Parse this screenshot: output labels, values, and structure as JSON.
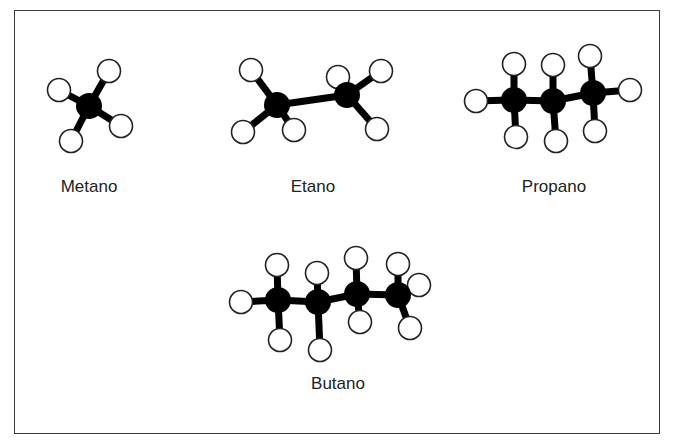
{
  "diagram": {
    "type": "ball-and-stick molecular models",
    "colors": {
      "carbon": "#000000",
      "hydrogen_fill": "#ffffff",
      "hydrogen_stroke": "#222222",
      "frame": "#3a3a3a"
    },
    "molecules": [
      {
        "name": "Metano",
        "carbons": [
          [
            89,
            106
          ]
        ],
        "hydrogens": [
          [
            59,
            90
          ],
          [
            109,
            71
          ],
          [
            121,
            126
          ],
          [
            71,
            141
          ]
        ],
        "bonds": [
          [
            89,
            106,
            59,
            90
          ],
          [
            89,
            106,
            109,
            71
          ],
          [
            89,
            106,
            121,
            126
          ],
          [
            89,
            106,
            71,
            141
          ]
        ],
        "label_pos": [
          89,
          192
        ]
      },
      {
        "name": "Etano",
        "carbons": [
          [
            277,
            105
          ],
          [
            347,
            95
          ]
        ],
        "hydrogens": [
          [
            251,
            70
          ],
          [
            243,
            132
          ],
          [
            294,
            130
          ],
          [
            338,
            77
          ],
          [
            381,
            71
          ],
          [
            377,
            129
          ]
        ],
        "bonds": [
          [
            277,
            105,
            347,
            95
          ],
          [
            277,
            105,
            251,
            70
          ],
          [
            277,
            105,
            243,
            132
          ],
          [
            277,
            105,
            294,
            130
          ],
          [
            347,
            95,
            338,
            77
          ],
          [
            347,
            95,
            381,
            71
          ],
          [
            347,
            95,
            377,
            129
          ]
        ],
        "label_pos": [
          313,
          192
        ]
      },
      {
        "name": "Propano",
        "carbons": [
          [
            514,
            100
          ],
          [
            553,
            101
          ],
          [
            593,
            93
          ]
        ],
        "hydrogens": [
          [
            476,
            101
          ],
          [
            514,
            64
          ],
          [
            516,
            137
          ],
          [
            553,
            65
          ],
          [
            556,
            141
          ],
          [
            590,
            56
          ],
          [
            595,
            131
          ],
          [
            630,
            90
          ]
        ],
        "bonds": [
          [
            476,
            101,
            514,
            100
          ],
          [
            514,
            100,
            553,
            101
          ],
          [
            553,
            101,
            593,
            93
          ],
          [
            593,
            93,
            630,
            90
          ],
          [
            514,
            100,
            514,
            64
          ],
          [
            514,
            100,
            516,
            137
          ],
          [
            553,
            101,
            553,
            65
          ],
          [
            553,
            101,
            556,
            141
          ],
          [
            593,
            93,
            590,
            56
          ],
          [
            593,
            93,
            595,
            131
          ]
        ],
        "label_pos": [
          554,
          192
        ]
      },
      {
        "name": "Butano",
        "carbons": [
          [
            278,
            300
          ],
          [
            318,
            302
          ],
          [
            357,
            294
          ],
          [
            398,
            295
          ]
        ],
        "hydrogens": [
          [
            241,
            302
          ],
          [
            277,
            265
          ],
          [
            280,
            340
          ],
          [
            317,
            273
          ],
          [
            320,
            350
          ],
          [
            356,
            258
          ],
          [
            360,
            322
          ],
          [
            398,
            264
          ],
          [
            419,
            285
          ],
          [
            410,
            328
          ]
        ],
        "bonds": [
          [
            241,
            302,
            278,
            300
          ],
          [
            278,
            300,
            318,
            302
          ],
          [
            318,
            302,
            357,
            294
          ],
          [
            357,
            294,
            398,
            295
          ],
          [
            278,
            300,
            277,
            265
          ],
          [
            278,
            300,
            280,
            340
          ],
          [
            318,
            302,
            317,
            273
          ],
          [
            318,
            302,
            320,
            350
          ],
          [
            357,
            294,
            356,
            258
          ],
          [
            357,
            294,
            360,
            322
          ],
          [
            398,
            295,
            398,
            264
          ],
          [
            398,
            295,
            419,
            285
          ],
          [
            398,
            295,
            410,
            328
          ]
        ],
        "label_pos": [
          338,
          389
        ]
      }
    ]
  }
}
